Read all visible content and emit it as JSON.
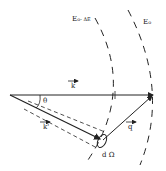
{
  "diagram": {
    "type": "scattering-kinematics",
    "labels": {
      "incident_vector": "k",
      "scattered_vector": "k'",
      "momentum_transfer": "q",
      "angle": "θ",
      "solid_angle": "d Ω",
      "outer_energy_sphere": "E",
      "outer_energy_sub": "o",
      "inner_energy_sphere": "E",
      "inner_energy_sub": "o",
      "inner_energy_suffix": "- ΔE"
    },
    "colors": {
      "ink": "#222222",
      "background": "#ffffff"
    }
  }
}
